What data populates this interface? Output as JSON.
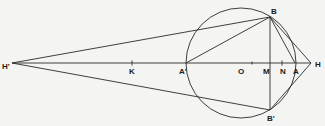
{
  "diagram": {
    "type": "geometric-construction",
    "points": {
      "H_prime": {
        "label": "H'",
        "x": 12,
        "y": 63
      },
      "K": {
        "label": "K",
        "x": 132,
        "y": 63
      },
      "A_prime": {
        "label": "A'",
        "x": 186,
        "y": 63
      },
      "O": {
        "label": "O",
        "x": 241,
        "y": 63
      },
      "M": {
        "label": "M",
        "x": 270,
        "y": 63
      },
      "N": {
        "label": "N",
        "x": 282,
        "y": 63
      },
      "A": {
        "label": "A",
        "x": 295,
        "y": 63
      },
      "H": {
        "label": "H",
        "x": 311,
        "y": 63
      },
      "B": {
        "label": "B",
        "x": 270,
        "y": 17
      },
      "B_prime": {
        "label": "B'",
        "x": 270,
        "y": 110
      }
    },
    "circle": {
      "center": "O",
      "cx": 241,
      "cy": 63,
      "r": 55
    },
    "segments": [
      [
        "H_prime",
        "H"
      ],
      [
        "H_prime",
        "B"
      ],
      [
        "H_prime",
        "B_prime"
      ],
      [
        "A_prime",
        "B"
      ],
      [
        "B",
        "B_prime"
      ],
      [
        "B",
        "A"
      ],
      [
        "B",
        "H"
      ],
      [
        "B_prime",
        "H"
      ]
    ],
    "colors": {
      "stroke": "#2a2a2a",
      "background": "#f4f4f2"
    }
  }
}
